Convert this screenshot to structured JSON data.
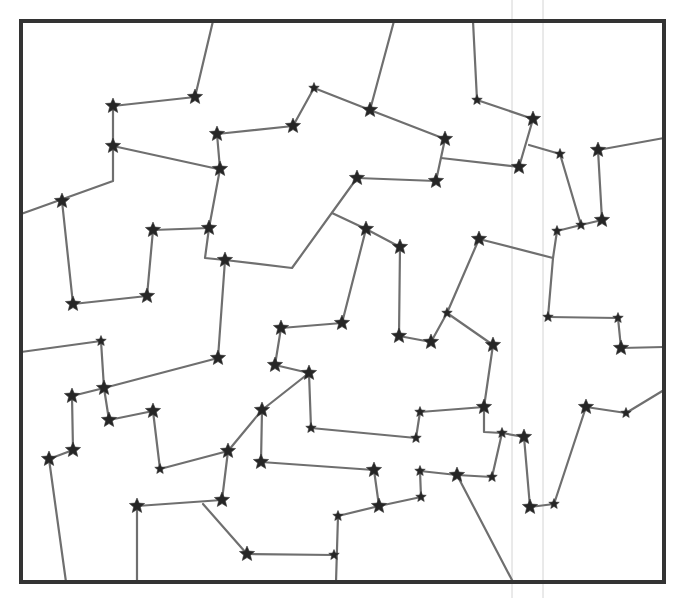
{
  "diagram": {
    "type": "star-connection-puzzle",
    "frame": {
      "x": 21,
      "y": 21,
      "width": 643,
      "height": 561,
      "color": "#333333"
    },
    "colors": {
      "edge": "#6f6f6f",
      "star": "#262626",
      "guide": "#d4d4d4",
      "background": "#ffffff"
    },
    "guides": [
      {
        "x": 512,
        "y1": 0,
        "y2": 598
      },
      {
        "x": 543,
        "y1": 0,
        "y2": 598
      }
    ],
    "stars": [
      {
        "id": "s1",
        "x": 113,
        "y": 106,
        "size": "large"
      },
      {
        "id": "s2",
        "x": 195,
        "y": 97,
        "size": "large"
      },
      {
        "id": "s3",
        "x": 113,
        "y": 146,
        "size": "large"
      },
      {
        "id": "s4",
        "x": 62,
        "y": 201,
        "size": "large"
      },
      {
        "id": "s5",
        "x": 217,
        "y": 134,
        "size": "large"
      },
      {
        "id": "s6",
        "x": 220,
        "y": 169,
        "size": "large"
      },
      {
        "id": "s7",
        "x": 314,
        "y": 88,
        "size": "small"
      },
      {
        "id": "s8",
        "x": 293,
        "y": 126,
        "size": "large"
      },
      {
        "id": "s9",
        "x": 370,
        "y": 110,
        "size": "large"
      },
      {
        "id": "s10",
        "x": 445,
        "y": 139,
        "size": "large"
      },
      {
        "id": "s11",
        "x": 436,
        "y": 181,
        "size": "large"
      },
      {
        "id": "s12",
        "x": 357,
        "y": 178,
        "size": "large"
      },
      {
        "id": "s13",
        "x": 477,
        "y": 100,
        "size": "small"
      },
      {
        "id": "s14",
        "x": 533,
        "y": 119,
        "size": "large"
      },
      {
        "id": "s15",
        "x": 519,
        "y": 167,
        "size": "large"
      },
      {
        "id": "s16",
        "x": 560,
        "y": 154,
        "size": "small"
      },
      {
        "id": "s17",
        "x": 598,
        "y": 150,
        "size": "large"
      },
      {
        "id": "s18",
        "x": 602,
        "y": 220,
        "size": "large"
      },
      {
        "id": "s19",
        "x": 581,
        "y": 225,
        "size": "small"
      },
      {
        "id": "s20",
        "x": 557,
        "y": 231,
        "size": "small"
      },
      {
        "id": "s21",
        "x": 153,
        "y": 230,
        "size": "large"
      },
      {
        "id": "s22",
        "x": 209,
        "y": 228,
        "size": "large"
      },
      {
        "id": "s23",
        "x": 147,
        "y": 296,
        "size": "large"
      },
      {
        "id": "s24",
        "x": 73,
        "y": 304,
        "size": "large"
      },
      {
        "id": "s25",
        "x": 225,
        "y": 260,
        "size": "large"
      },
      {
        "id": "s26",
        "x": 366,
        "y": 229,
        "size": "large"
      },
      {
        "id": "s27",
        "x": 400,
        "y": 247,
        "size": "large"
      },
      {
        "id": "s28",
        "x": 342,
        "y": 323,
        "size": "large"
      },
      {
        "id": "s29",
        "x": 281,
        "y": 328,
        "size": "large"
      },
      {
        "id": "s30",
        "x": 275,
        "y": 365,
        "size": "large"
      },
      {
        "id": "s31",
        "x": 309,
        "y": 373,
        "size": "large"
      },
      {
        "id": "s32",
        "x": 479,
        "y": 239,
        "size": "large"
      },
      {
        "id": "s33",
        "x": 447,
        "y": 313,
        "size": "small"
      },
      {
        "id": "s34",
        "x": 493,
        "y": 345,
        "size": "large"
      },
      {
        "id": "s35",
        "x": 431,
        "y": 342,
        "size": "large"
      },
      {
        "id": "s36",
        "x": 399,
        "y": 336,
        "size": "large"
      },
      {
        "id": "s37",
        "x": 548,
        "y": 317,
        "size": "small"
      },
      {
        "id": "s38",
        "x": 618,
        "y": 318,
        "size": "small"
      },
      {
        "id": "s39",
        "x": 621,
        "y": 348,
        "size": "large"
      },
      {
        "id": "s40",
        "x": 101,
        "y": 341,
        "size": "small"
      },
      {
        "id": "s41",
        "x": 104,
        "y": 388,
        "size": "large"
      },
      {
        "id": "s42",
        "x": 72,
        "y": 396,
        "size": "large"
      },
      {
        "id": "s43",
        "x": 73,
        "y": 450,
        "size": "large"
      },
      {
        "id": "s44",
        "x": 49,
        "y": 459,
        "size": "large"
      },
      {
        "id": "s45",
        "x": 218,
        "y": 358,
        "size": "large"
      },
      {
        "id": "s46",
        "x": 109,
        "y": 420,
        "size": "large"
      },
      {
        "id": "s47",
        "x": 153,
        "y": 411,
        "size": "large"
      },
      {
        "id": "s48",
        "x": 160,
        "y": 469,
        "size": "small"
      },
      {
        "id": "s49",
        "x": 228,
        "y": 451,
        "size": "large"
      },
      {
        "id": "s50",
        "x": 222,
        "y": 500,
        "size": "large"
      },
      {
        "id": "s51",
        "x": 137,
        "y": 506,
        "size": "large"
      },
      {
        "id": "s52",
        "x": 262,
        "y": 410,
        "size": "large"
      },
      {
        "id": "s53",
        "x": 261,
        "y": 462,
        "size": "large"
      },
      {
        "id": "s54",
        "x": 311,
        "y": 428,
        "size": "small"
      },
      {
        "id": "s55",
        "x": 416,
        "y": 438,
        "size": "small"
      },
      {
        "id": "s56",
        "x": 420,
        "y": 412,
        "size": "small"
      },
      {
        "id": "s57",
        "x": 484,
        "y": 407,
        "size": "large"
      },
      {
        "id": "s58",
        "x": 374,
        "y": 470,
        "size": "large"
      },
      {
        "id": "s59",
        "x": 379,
        "y": 506,
        "size": "large"
      },
      {
        "id": "s60",
        "x": 338,
        "y": 516,
        "size": "small"
      },
      {
        "id": "s61",
        "x": 421,
        "y": 497,
        "size": "small"
      },
      {
        "id": "s62",
        "x": 420,
        "y": 471,
        "size": "small"
      },
      {
        "id": "s63",
        "x": 457,
        "y": 475,
        "size": "large"
      },
      {
        "id": "s64",
        "x": 492,
        "y": 477,
        "size": "small"
      },
      {
        "id": "s65",
        "x": 502,
        "y": 433,
        "size": "small"
      },
      {
        "id": "s66",
        "x": 524,
        "y": 437,
        "size": "large"
      },
      {
        "id": "s67",
        "x": 530,
        "y": 507,
        "size": "large"
      },
      {
        "id": "s68",
        "x": 554,
        "y": 504,
        "size": "small"
      },
      {
        "id": "s69",
        "x": 586,
        "y": 407,
        "size": "large"
      },
      {
        "id": "s70",
        "x": 626,
        "y": 413,
        "size": "small"
      },
      {
        "id": "s71",
        "x": 247,
        "y": 554,
        "size": "large"
      },
      {
        "id": "s72",
        "x": 334,
        "y": 555,
        "size": "small"
      }
    ],
    "edges": [
      [
        [
          213,
          21
        ],
        [
          195,
          97
        ]
      ],
      [
        [
          195,
          97
        ],
        [
          113,
          106
        ]
      ],
      [
        [
          113,
          106
        ],
        [
          113,
          146
        ]
      ],
      [
        [
          113,
          146
        ],
        [
          218,
          169
        ]
      ],
      [
        [
          113,
          146
        ],
        [
          113,
          181
        ],
        [
          21,
          214
        ]
      ],
      [
        [
          62,
          201
        ],
        [
          73,
          304
        ]
      ],
      [
        [
          217,
          134
        ],
        [
          220,
          169
        ]
      ],
      [
        [
          217,
          134
        ],
        [
          293,
          126
        ]
      ],
      [
        [
          293,
          126
        ],
        [
          314,
          88
        ]
      ],
      [
        [
          314,
          88
        ],
        [
          370,
          110
        ]
      ],
      [
        [
          394,
          21
        ],
        [
          370,
          110
        ]
      ],
      [
        [
          370,
          110
        ],
        [
          445,
          139
        ]
      ],
      [
        [
          445,
          139
        ],
        [
          436,
          181
        ]
      ],
      [
        [
          436,
          181
        ],
        [
          357,
          178
        ]
      ],
      [
        [
          441,
          158
        ],
        [
          519,
          167
        ]
      ],
      [
        [
          473,
          21
        ],
        [
          477,
          100
        ]
      ],
      [
        [
          477,
          100
        ],
        [
          533,
          119
        ]
      ],
      [
        [
          533,
          119
        ],
        [
          519,
          167
        ]
      ],
      [
        [
          529,
          145
        ],
        [
          560,
          154
        ]
      ],
      [
        [
          560,
          154
        ],
        [
          581,
          225
        ]
      ],
      [
        [
          581,
          225
        ],
        [
          602,
          220
        ]
      ],
      [
        [
          598,
          150
        ],
        [
          602,
          220
        ]
      ],
      [
        [
          598,
          150
        ],
        [
          664,
          138
        ]
      ],
      [
        [
          581,
          225
        ],
        [
          557,
          231
        ]
      ],
      [
        [
          220,
          169
        ],
        [
          209,
          228
        ]
      ],
      [
        [
          209,
          228
        ],
        [
          153,
          230
        ]
      ],
      [
        [
          153,
          230
        ],
        [
          147,
          296
        ]
      ],
      [
        [
          147,
          296
        ],
        [
          73,
          304
        ]
      ],
      [
        [
          209,
          228
        ],
        [
          205,
          258
        ],
        [
          225,
          260
        ]
      ],
      [
        [
          225,
          260
        ],
        [
          292,
          268
        ],
        [
          357,
          178
        ]
      ],
      [
        [
          332,
          213
        ],
        [
          366,
          229
        ]
      ],
      [
        [
          366,
          229
        ],
        [
          400,
          247
        ]
      ],
      [
        [
          366,
          229
        ],
        [
          342,
          323
        ]
      ],
      [
        [
          342,
          323
        ],
        [
          281,
          328
        ]
      ],
      [
        [
          281,
          328
        ],
        [
          275,
          365
        ]
      ],
      [
        [
          275,
          365
        ],
        [
          309,
          373
        ]
      ],
      [
        [
          400,
          247
        ],
        [
          399,
          336
        ]
      ],
      [
        [
          399,
          336
        ],
        [
          431,
          342
        ]
      ],
      [
        [
          431,
          342
        ],
        [
          447,
          313
        ]
      ],
      [
        [
          447,
          313
        ],
        [
          479,
          239
        ]
      ],
      [
        [
          479,
          239
        ],
        [
          553,
          258
        ]
      ],
      [
        [
          557,
          231
        ],
        [
          553,
          258
        ],
        [
          548,
          317
        ]
      ],
      [
        [
          447,
          313
        ],
        [
          493,
          345
        ]
      ],
      [
        [
          493,
          345
        ],
        [
          484,
          407
        ]
      ],
      [
        [
          548,
          317
        ],
        [
          618,
          318
        ]
      ],
      [
        [
          618,
          318
        ],
        [
          621,
          348
        ]
      ],
      [
        [
          621,
          348
        ],
        [
          664,
          347
        ]
      ],
      [
        [
          21,
          352
        ],
        [
          101,
          341
        ]
      ],
      [
        [
          101,
          341
        ],
        [
          104,
          388
        ]
      ],
      [
        [
          104,
          388
        ],
        [
          72,
          396
        ]
      ],
      [
        [
          104,
          388
        ],
        [
          218,
          358
        ]
      ],
      [
        [
          218,
          358
        ],
        [
          225,
          260
        ]
      ],
      [
        [
          72,
          396
        ],
        [
          73,
          450
        ]
      ],
      [
        [
          73,
          450
        ],
        [
          49,
          459
        ]
      ],
      [
        [
          49,
          459
        ],
        [
          66,
          582
        ]
      ],
      [
        [
          104,
          388
        ],
        [
          109,
          420
        ]
      ],
      [
        [
          109,
          420
        ],
        [
          153,
          411
        ]
      ],
      [
        [
          153,
          411
        ],
        [
          160,
          469
        ]
      ],
      [
        [
          160,
          469
        ],
        [
          228,
          451
        ]
      ],
      [
        [
          228,
          451
        ],
        [
          222,
          500
        ]
      ],
      [
        [
          222,
          500
        ],
        [
          137,
          506
        ]
      ],
      [
        [
          137,
          506
        ],
        [
          137,
          582
        ]
      ],
      [
        [
          228,
          451
        ],
        [
          262,
          410
        ]
      ],
      [
        [
          262,
          410
        ],
        [
          309,
          373
        ]
      ],
      [
        [
          309,
          373
        ],
        [
          311,
          428
        ]
      ],
      [
        [
          311,
          428
        ],
        [
          416,
          438
        ]
      ],
      [
        [
          416,
          438
        ],
        [
          420,
          412
        ]
      ],
      [
        [
          420,
          412
        ],
        [
          484,
          407
        ]
      ],
      [
        [
          262,
          410
        ],
        [
          261,
          462
        ]
      ],
      [
        [
          261,
          462
        ],
        [
          374,
          470
        ]
      ],
      [
        [
          374,
          470
        ],
        [
          379,
          506
        ]
      ],
      [
        [
          379,
          506
        ],
        [
          338,
          516
        ]
      ],
      [
        [
          379,
          506
        ],
        [
          421,
          497
        ]
      ],
      [
        [
          421,
          497
        ],
        [
          420,
          471
        ]
      ],
      [
        [
          420,
          471
        ],
        [
          457,
          475
        ]
      ],
      [
        [
          457,
          475
        ],
        [
          492,
          477
        ]
      ],
      [
        [
          492,
          477
        ],
        [
          502,
          433
        ]
      ],
      [
        [
          484,
          407
        ],
        [
          484,
          432
        ],
        [
          502,
          433
        ]
      ],
      [
        [
          502,
          433
        ],
        [
          524,
          437
        ]
      ],
      [
        [
          524,
          437
        ],
        [
          530,
          507
        ]
      ],
      [
        [
          530,
          507
        ],
        [
          554,
          504
        ]
      ],
      [
        [
          554,
          504
        ],
        [
          586,
          407
        ]
      ],
      [
        [
          586,
          407
        ],
        [
          626,
          413
        ]
      ],
      [
        [
          626,
          413
        ],
        [
          664,
          390
        ]
      ],
      [
        [
          457,
          475
        ],
        [
          513,
          582
        ]
      ],
      [
        [
          203,
          504
        ],
        [
          247,
          554
        ]
      ],
      [
        [
          247,
          554
        ],
        [
          334,
          555
        ]
      ],
      [
        [
          338,
          516
        ],
        [
          336,
          582
        ]
      ]
    ]
  }
}
